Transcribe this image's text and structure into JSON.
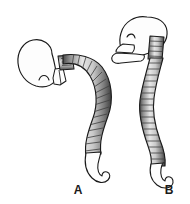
{
  "figure": {
    "background_color": "#ffffff",
    "outline_color": "#1a1a1a",
    "bone_fill_color": "#fdfdfd",
    "vertebra_fill_color": "#b4b4b4",
    "vertebra_shadow_color": "#5a5a5a",
    "vertebra_highlight_color": "#e8e8e8",
    "label_color": "#1a1a1a"
  },
  "panels": [
    {
      "id": "a",
      "label": "A",
      "description": "Skull flexed forward with head drooping, cervical spine horizontal, kyphotic curved vertebral column ending in hooked coccyx",
      "head_posture": "flexed-forward",
      "icon_name": "skull-spine-flexed-icon"
    },
    {
      "id": "b",
      "label": "B",
      "description": "Skull upright in neutral position with visible mandible, vertical cervical spine, gently curved vertebral column ending in hooked coccyx",
      "head_posture": "upright-neutral",
      "icon_name": "skull-spine-upright-icon"
    }
  ],
  "labels": {
    "a": "A",
    "b": "B"
  }
}
